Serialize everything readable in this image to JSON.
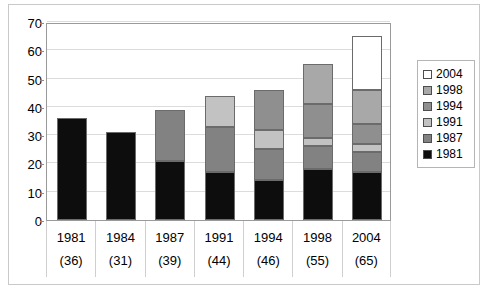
{
  "chart_data": {
    "type": "bar",
    "subtype": "stacked-bar",
    "title": "",
    "xlabel": "",
    "ylabel": "",
    "ylim": [
      0,
      70
    ],
    "yticks": [
      0,
      10,
      20,
      30,
      40,
      50,
      60,
      70
    ],
    "grid": true,
    "legend_position": "right",
    "categories": [
      "1981",
      "1984",
      "1987",
      "1991",
      "1994",
      "1998",
      "2004"
    ],
    "category_totals": [
      36,
      31,
      39,
      44,
      46,
      55,
      65
    ],
    "category_total_labels": [
      "(36)",
      "(31)",
      "(39)",
      "(44)",
      "(46)",
      "(55)",
      "(65)"
    ],
    "series": [
      {
        "name": "1981",
        "color": "#0d0d0d",
        "values": [
          36,
          31,
          21,
          17,
          14,
          18,
          17
        ]
      },
      {
        "name": "1987",
        "color": "#828282",
        "values": [
          0,
          0,
          18,
          16,
          11,
          8,
          7
        ]
      },
      {
        "name": "1991",
        "color": "#c2c2c2",
        "values": [
          0,
          0,
          0,
          11,
          7,
          3,
          3
        ]
      },
      {
        "name": "1994",
        "color": "#8f8f8f",
        "values": [
          0,
          0,
          0,
          0,
          14,
          12,
          7
        ]
      },
      {
        "name": "1998",
        "color": "#a8a8a8",
        "values": [
          0,
          0,
          0,
          0,
          0,
          14,
          12
        ]
      },
      {
        "name": "2004",
        "color": "#ffffff",
        "values": [
          0,
          0,
          0,
          0,
          0,
          0,
          19
        ]
      }
    ],
    "segment_tops": {
      "1981": [
        36,
        31,
        21,
        17,
        14,
        18,
        17
      ],
      "1987": [
        null,
        null,
        39,
        33,
        25,
        26,
        24
      ],
      "1991": [
        null,
        null,
        null,
        44,
        32,
        29,
        27
      ],
      "1994": [
        null,
        null,
        null,
        null,
        46,
        41,
        34
      ],
      "1998": [
        null,
        null,
        null,
        null,
        null,
        55,
        46
      ],
      "2004": [
        null,
        null,
        null,
        null,
        null,
        null,
        65
      ]
    }
  },
  "legend": {
    "entries": [
      {
        "label": "2004",
        "color": "#ffffff"
      },
      {
        "label": "1998",
        "color": "#a8a8a8"
      },
      {
        "label": "1994",
        "color": "#8f8f8f"
      },
      {
        "label": "1991",
        "color": "#c2c2c2"
      },
      {
        "label": "1987",
        "color": "#828282"
      },
      {
        "label": "1981",
        "color": "#0d0d0d"
      }
    ]
  },
  "axis": {
    "y_tick_labels": [
      "70",
      "60",
      "50",
      "40",
      "30",
      "20",
      "10",
      "0"
    ]
  }
}
